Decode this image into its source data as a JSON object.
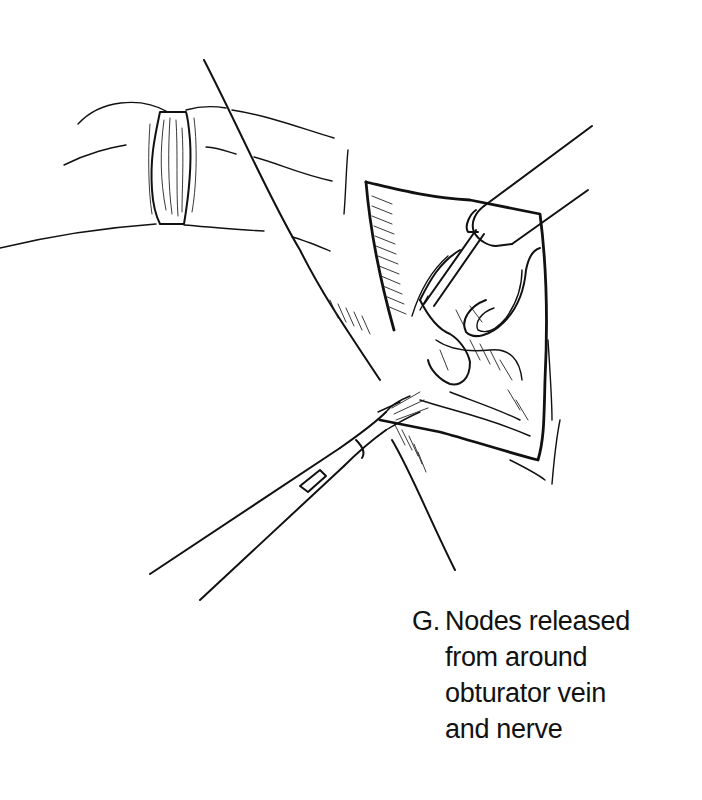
{
  "figure": {
    "label": "G.",
    "caption": "Nodes released\nfrom around\nobturator vein\nand nerve",
    "caption_lines": [
      "Nodes released",
      "from around",
      "obturator vein",
      "and nerve"
    ],
    "elements": [
      "skin-fold-with-clamp",
      "incision-wound",
      "upper-right-instrument",
      "lower-left-forceps",
      "lymph-node-tissue",
      "obturator-vein",
      "obturator-nerve"
    ],
    "colors": {
      "ink": "#111111",
      "background": "#ffffff"
    }
  }
}
